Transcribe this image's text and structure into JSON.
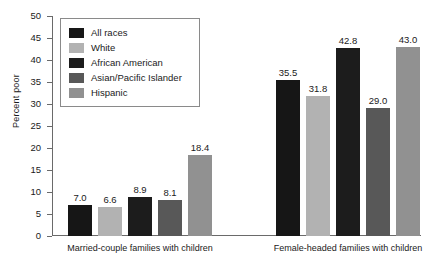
{
  "chart_data": {
    "type": "bar",
    "title": "",
    "xlabel": "",
    "ylabel": "Percent poor",
    "ylim": [
      0,
      50
    ],
    "ytick_step": 5,
    "yticks": [
      "50",
      "45",
      "40",
      "35",
      "30",
      "25",
      "20",
      "15",
      "10",
      "5",
      "0"
    ],
    "grid": false,
    "legend_position": "upper-left-inside",
    "categories": [
      "Married-couple families with children",
      "Female-headed families with children"
    ],
    "series": [
      {
        "name": "All races",
        "color": "#161616",
        "values": [
          7.0,
          35.5
        ],
        "labels": [
          "7.0",
          "35.5"
        ]
      },
      {
        "name": "White",
        "color": "#b2b2b2",
        "values": [
          6.6,
          31.8
        ],
        "labels": [
          "6.6",
          "31.8"
        ]
      },
      {
        "name": "African American",
        "color": "#1c1c1c",
        "values": [
          8.9,
          42.8
        ],
        "labels": [
          "8.9",
          "42.8"
        ]
      },
      {
        "name": "Asian/Pacific Islander",
        "color": "#585858",
        "values": [
          8.1,
          29.0
        ],
        "labels": [
          "8.1",
          "29.0"
        ]
      },
      {
        "name": "Hispanic",
        "color": "#919191",
        "values": [
          18.4,
          43.0
        ],
        "labels": [
          "18.4",
          "43.0"
        ]
      }
    ]
  },
  "axis": {
    "y_title": "Percent poor"
  }
}
